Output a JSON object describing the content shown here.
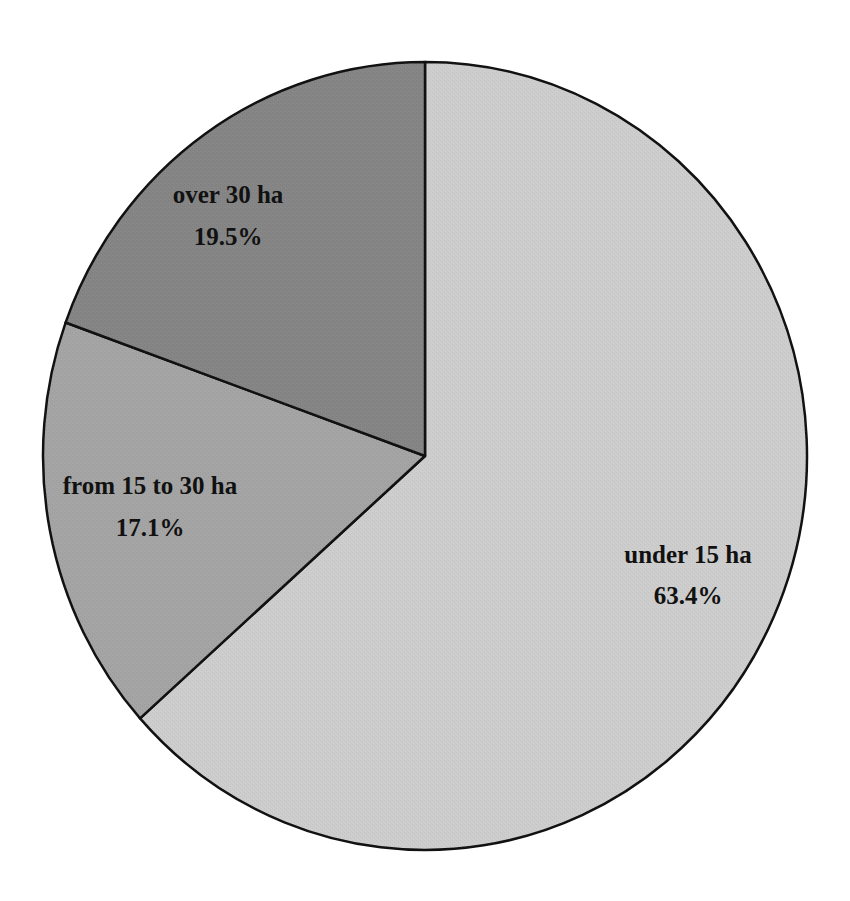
{
  "chart_data": {
    "type": "pie",
    "title": "",
    "categories": [
      "under 15 ha",
      "from 15 to 30 ha",
      "over 30 ha"
    ],
    "values": [
      63.4,
      17.1,
      19.5
    ],
    "value_labels": [
      "63.4%",
      "17.1%",
      "19.5%"
    ],
    "colors": [
      "#cdcdcd",
      "#a4a4a4",
      "#858585"
    ],
    "start_angle_deg": 0,
    "direction": "clockwise",
    "legend": "none",
    "labels_inside": true
  },
  "slices": [
    {
      "name": "under 15 ha",
      "pct": "63.4%"
    },
    {
      "name": "from 15 to 30 ha",
      "pct": "17.1%"
    },
    {
      "name": "over 30 ha",
      "pct": "19.5%"
    }
  ]
}
